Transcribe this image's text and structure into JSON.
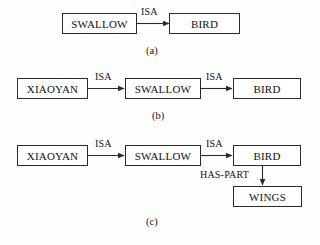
{
  "figure": {
    "background_color": "#fefefe",
    "line_color": "#2b2b2b",
    "text_color": "#111111"
  },
  "rows": [
    {
      "caption": "(a)",
      "nodes": [
        {
          "label": "SWALLOW"
        },
        {
          "label": "BIRD"
        }
      ],
      "edges": [
        {
          "label": "ISA",
          "from": "SWALLOW",
          "to": "BIRD",
          "direction": "right"
        }
      ]
    },
    {
      "caption": "(b)",
      "nodes": [
        {
          "label": "XIAOYAN"
        },
        {
          "label": "SWALLOW"
        },
        {
          "label": "BIRD"
        }
      ],
      "edges": [
        {
          "label": "ISA",
          "from": "XIAOYAN",
          "to": "SWALLOW",
          "direction": "right"
        },
        {
          "label": "ISA",
          "from": "SWALLOW",
          "to": "BIRD",
          "direction": "right"
        }
      ]
    },
    {
      "caption": "(c)",
      "nodes": [
        {
          "label": "XIAOYAN"
        },
        {
          "label": "SWALLOW"
        },
        {
          "label": "BIRD"
        },
        {
          "label": "WINGS"
        }
      ],
      "edges": [
        {
          "label": "ISA",
          "from": "XIAOYAN",
          "to": "SWALLOW",
          "direction": "right"
        },
        {
          "label": "ISA",
          "from": "SWALLOW",
          "to": "BIRD",
          "direction": "right"
        },
        {
          "label": "HAS-PART",
          "from": "BIRD",
          "to": "WINGS",
          "direction": "down"
        }
      ]
    }
  ]
}
